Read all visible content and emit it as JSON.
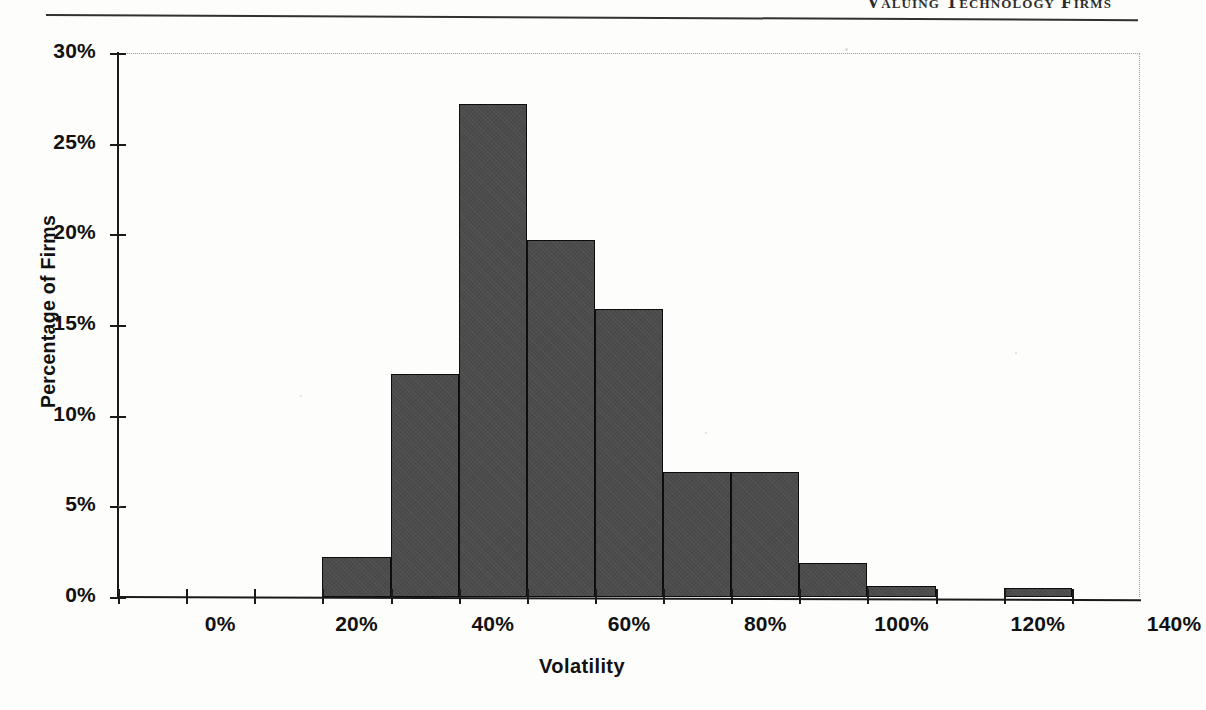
{
  "page": {
    "running_head": "Valuing Technology Firms",
    "rule": "header-rule"
  },
  "chart_data": {
    "type": "bar",
    "title": "",
    "subtitle": "",
    "xlabel": "Volatility",
    "ylabel": "Percentage of Firms",
    "bin_width": 10,
    "xlim": [
      -10,
      140
    ],
    "ylim": [
      0,
      30
    ],
    "grid": false,
    "legend": null,
    "legend_position": "none",
    "bar_color": "#4b4b4b",
    "bar_edge_color": "#0d0d0d",
    "x_tick_labels": [
      "0%",
      "20%",
      "40%",
      "60%",
      "80%",
      "100%",
      "120%",
      "140%"
    ],
    "x_tick_values": [
      0,
      20,
      40,
      60,
      80,
      100,
      120,
      140
    ],
    "y_tick_labels": [
      "0%",
      "5%",
      "10%",
      "15%",
      "20%",
      "25%",
      "30%"
    ],
    "y_tick_values": [
      0,
      5,
      10,
      15,
      20,
      25,
      30
    ],
    "categories": [
      "0%",
      "10%",
      "20%",
      "30%",
      "40%",
      "50%",
      "60%",
      "70%",
      "80%",
      "90%",
      "100%",
      "110%",
      "120%",
      "130%"
    ],
    "bin_starts": [
      -10,
      0,
      10,
      20,
      30,
      40,
      50,
      60,
      70,
      80,
      90,
      100,
      110,
      120,
      130
    ],
    "values": [
      0,
      0,
      0,
      2.2,
      12.3,
      27.2,
      19.7,
      15.9,
      6.9,
      6.9,
      1.9,
      0.6,
      0.0,
      0.5
    ],
    "annotations": []
  }
}
